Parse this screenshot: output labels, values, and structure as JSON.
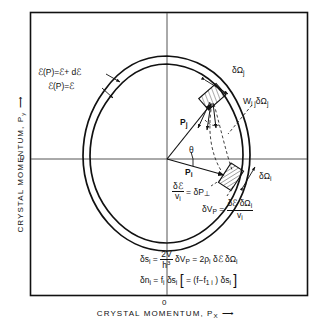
{
  "figure": {
    "domain": "physics-diagram",
    "background": "#ffffff",
    "ink": "#111111"
  },
  "axes": {
    "x_label": "CRYSTAL MOMENTUM,  P",
    "x_label_sub": "X",
    "x_arrow": "⟶",
    "y_label": "CRYSTAL MOMENTUM,  P",
    "y_label_sub": "y",
    "y_arrow": "⟶",
    "origin_x": "0",
    "origin_y": "0"
  },
  "contour_labels": {
    "outer": "ℰ(P)=ℰ+ dℰ",
    "inner": "ℰ(P)=ℰ"
  },
  "annotations": {
    "omega_j": "δΩ",
    "omega_j_sub": "j",
    "w_ij": "W",
    "w_ij_sub1": "i j",
    "w_ij_mid": "δΩ",
    "w_ij_sub2": "j",
    "omega_i": "δΩ",
    "omega_i_sub": "i",
    "p_j": "P",
    "p_j_sub": "j",
    "p_i": "P",
    "p_i_sub": "i",
    "theta": "θ",
    "dperp_num": "δℰ",
    "dperp_den": "v",
    "dperp_den_sub": "i",
    "dperp_eq": "= δP",
    "dperp_eq_sub": "⊥",
    "dvp_lhs": "δV",
    "dvp_lhs_sub": "P",
    "dvp_eq": "=",
    "dvp_num": "δℰ δΩ",
    "dvp_num_sub": "i",
    "dvp_den": "v",
    "dvp_den_sub": "i"
  },
  "equations": {
    "line1": {
      "lhs": "δs",
      "lhs_sub": "i",
      "eq1": "=",
      "num": "2V",
      "den": "h",
      "den_sup": "3",
      "mid": "δV",
      "mid_sub": "P",
      "eq2": "= 2ρ",
      "eq2_sub": "i",
      "tail": "δℰ δΩ",
      "tail_sub": "i"
    },
    "line2": {
      "lhs": "δn",
      "lhs_sub": "i",
      "eq": "= f",
      "eq_sub": "i",
      "mid": "δs",
      "mid_sub": "i",
      "bracket_open": "[",
      "inner": "= (f−f",
      "inner_sub": "1 i",
      "inner2": ") δs",
      "inner2_sub": "i",
      "bracket_close": "]"
    }
  }
}
